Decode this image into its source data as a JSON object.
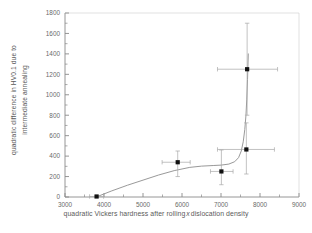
{
  "figure": {
    "background_color": "#ffffff",
    "axis_color": "#8a8a8a",
    "marker_color": "#111111",
    "curve_color": "#8d8d8d",
    "errorbar_color": "#a8a8a8"
  },
  "chart_data": {
    "type": "scatter",
    "title": "",
    "xlabel_part1": "quadratic Vickers hardness after rolling",
    "xlabel_var": "x",
    "xlabel_part2": "dislocation density",
    "ylabel_line1": "quadratic difference in HV0.1 due to",
    "ylabel_line2": "intermediate annealing",
    "xlim": [
      3000,
      9000
    ],
    "ylim": [
      0,
      1800
    ],
    "xticks": [
      3000,
      4000,
      5000,
      6000,
      7000,
      8000,
      9000
    ],
    "yticks": [
      0,
      200,
      400,
      600,
      800,
      1000,
      1200,
      1400,
      1600,
      1800
    ],
    "xtick_labels": [
      "3000",
      "4000",
      "5000",
      "6000",
      "7000",
      "8000",
      "9000"
    ],
    "ytick_labels": [
      "0",
      "200",
      "400",
      "600",
      "800",
      "1000",
      "1200",
      "1400",
      "1600",
      "1800"
    ],
    "minor_ticks": true,
    "grid": false,
    "legend": "none",
    "points": [
      {
        "x": 3810,
        "y": 5,
        "xerr_low": 180,
        "xerr_high": 180,
        "yerr_low": 5,
        "yerr_high": 5
      },
      {
        "x": 5890,
        "y": 340,
        "xerr_low": 400,
        "xerr_high": 320,
        "yerr_low": 140,
        "yerr_high": 110
      },
      {
        "x": 7010,
        "y": 250,
        "xerr_low": 280,
        "xerr_high": 300,
        "yerr_low": 130,
        "yerr_high": 210
      },
      {
        "x": 7650,
        "y": 465,
        "xerr_low": 740,
        "xerr_high": 720,
        "yerr_low": 240,
        "yerr_high": 260
      },
      {
        "x": 7670,
        "y": 1250,
        "xerr_low": 760,
        "xerr_high": 780,
        "yerr_low": 450,
        "yerr_high": 450
      }
    ],
    "fit_curve": {
      "description": "monotonic fit rising slowly then sharply near x=7600",
      "x": [
        3800,
        4200,
        4600,
        5000,
        5400,
        5800,
        6200,
        6500,
        6800,
        7000,
        7200,
        7350,
        7450,
        7520,
        7570,
        7610,
        7640,
        7660,
        7680,
        7700
      ],
      "y": [
        0,
        60,
        115,
        165,
        215,
        258,
        290,
        302,
        308,
        312,
        322,
        345,
        385,
        450,
        540,
        660,
        800,
        950,
        1150,
        1400
      ]
    }
  }
}
